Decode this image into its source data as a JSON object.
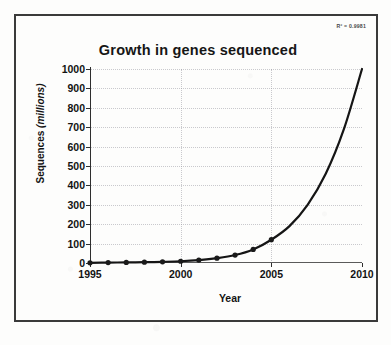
{
  "figure": {
    "r_squared_label": "R² = 0.9981",
    "border_color": "#3a3a3a",
    "background_color": "#fdfdfc"
  },
  "chart_data": {
    "type": "line",
    "title": "Growth in genes sequenced",
    "xlabel": "Year",
    "ylabel_main": "Sequences ",
    "ylabel_unit": "(millions)",
    "ylabel": "Sequences (millions)",
    "xlim": [
      1995,
      2010
    ],
    "ylim": [
      0,
      1000
    ],
    "xticks": [
      1995,
      2000,
      2005,
      2010
    ],
    "xtick_labels": [
      "1995",
      "2000",
      "2005",
      "2010"
    ],
    "yticks": [
      0,
      100,
      200,
      300,
      400,
      500,
      600,
      700,
      800,
      900,
      1000
    ],
    "ytick_labels": [
      "0",
      "100",
      "200",
      "300",
      "400",
      "500",
      "600",
      "700",
      "800",
      "900",
      "1000"
    ],
    "grid": true,
    "legend": false,
    "marker_color": "#1a1a1a",
    "line_color": "#151515",
    "series": [
      {
        "name": "Sequences (millions)",
        "x": [
          1995,
          1996,
          1997,
          1998,
          1999,
          2000,
          2001,
          2002,
          2003,
          2004,
          2005
        ],
        "values": [
          1,
          2,
          3,
          4,
          6,
          9,
          15,
          25,
          41,
          70,
          120
        ]
      }
    ],
    "trendline": {
      "name": "Exponential fit",
      "x": [
        1995,
        1996,
        1997,
        1998,
        1999,
        2000,
        2001,
        2002,
        2003,
        2004,
        2005,
        2006,
        2007,
        2008,
        2009,
        2010
      ],
      "values": [
        1,
        2,
        3,
        4,
        6,
        9,
        15,
        25,
        41,
        70,
        120,
        190,
        300,
        460,
        690,
        1000
      ]
    },
    "annotations": [
      "R² = 0.9981"
    ]
  }
}
